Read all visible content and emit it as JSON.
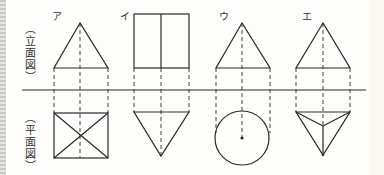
{
  "figure": {
    "view_labels": {
      "elevation": "（立面図）",
      "plan": "（平面図）"
    },
    "elevation_chars": [
      "︵",
      "立",
      "面",
      "図",
      "︶"
    ],
    "plan_chars": [
      "︵",
      "平",
      "面",
      "図",
      "︶"
    ],
    "options": [
      {
        "label": "ア",
        "elevation": "triangle",
        "plan": "square-with-diagonals"
      },
      {
        "label": "イ",
        "elevation": "rectangle-split",
        "plan": "inverted-triangle"
      },
      {
        "label": "ウ",
        "elevation": "triangle",
        "plan": "circle-with-center"
      },
      {
        "label": "エ",
        "elevation": "triangle",
        "plan": "triangle-pyramid"
      }
    ],
    "colors": {
      "line": "#2a2a2a",
      "background": "#fdfdfb"
    }
  }
}
